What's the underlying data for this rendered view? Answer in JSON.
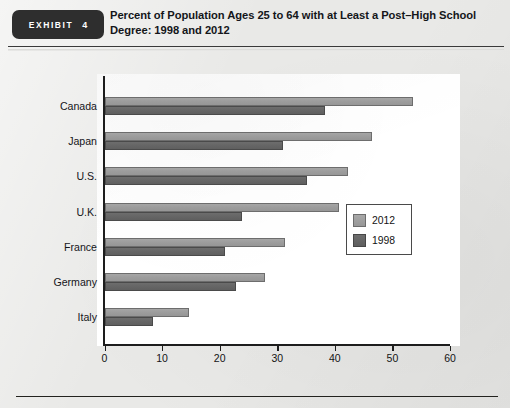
{
  "exhibit": {
    "word": "EXHIBIT",
    "number": "4",
    "title": "Percent of Population Ages 25 to 64 with at Least a Post–High School Degree: 1998 and 2012"
  },
  "chart_data": {
    "type": "bar",
    "orientation": "horizontal",
    "title": "Percent of Population Ages 25 to 64 with at Least a Post–High School Degree: 1998 and 2012",
    "xlabel": "",
    "ylabel": "",
    "xlim": [
      0,
      60
    ],
    "xticks": [
      0,
      10,
      20,
      30,
      40,
      50,
      60
    ],
    "xtick_labels": [
      "0",
      "10",
      "20",
      "30",
      "40",
      "50",
      "60"
    ],
    "grid": false,
    "legend_position": "center-right inside plot",
    "categories": [
      "Canada",
      "Japan",
      "U.S.",
      "U.K.",
      "France",
      "Germany",
      "Italy"
    ],
    "series": [
      {
        "name": "2012",
        "color": "#9e9e9e",
        "values": [
          53.5,
          46.5,
          42.2,
          40.8,
          31.4,
          27.9,
          14.7
        ]
      },
      {
        "name": "1998",
        "color": "#666666",
        "values": [
          38.3,
          31.0,
          35.2,
          23.8,
          21.0,
          22.8,
          8.5
        ]
      }
    ]
  },
  "legend": {
    "entries": [
      {
        "label": "2012",
        "swatch": "y2012"
      },
      {
        "label": "1998",
        "swatch": "y1998"
      }
    ]
  },
  "ghosts": [
    {
      "text": "LOW SKILL",
      "x": 120,
      "y": 268,
      "size": 21
    },
    {
      "text": "and",
      "x": 150,
      "y": 300,
      "size": 13
    }
  ]
}
